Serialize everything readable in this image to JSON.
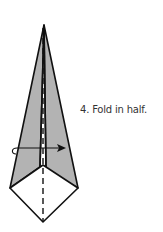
{
  "diagram": {
    "step_number": "4.",
    "instruction": "Fold in half.",
    "colors": {
      "shaded_paper": "#b3b3b3",
      "white_paper": "#ffffff",
      "line": "#111111"
    },
    "elements": [
      {
        "name": "kite-upper-shaded-flaps",
        "shape": "triangle-pair",
        "fill": "shaded"
      },
      {
        "name": "kite-lower-diamond",
        "shape": "quadrilateral",
        "fill": "white"
      },
      {
        "name": "center-fold-line",
        "style": "dashed"
      },
      {
        "name": "fold-arrow",
        "direction": "left-to-right",
        "meaning": "fold-in-half"
      }
    ]
  }
}
